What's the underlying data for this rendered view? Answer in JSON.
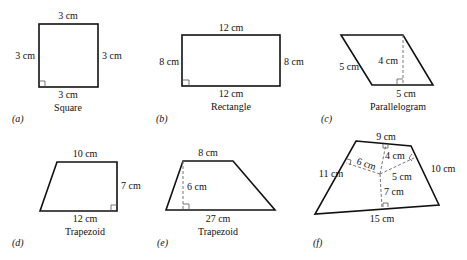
{
  "figures": [
    {
      "id": "a",
      "caption": "(a)",
      "name": "Square",
      "labels": {
        "top": "3 cm",
        "left": "3 cm",
        "right": "3 cm",
        "bottom": "3 cm"
      }
    },
    {
      "id": "b",
      "caption": "(b)",
      "name": "Rectangle",
      "labels": {
        "top": "12 cm",
        "left": "8 cm",
        "right": "8 cm",
        "bottom": "12 cm"
      }
    },
    {
      "id": "c",
      "caption": "(c)",
      "name": "Parallelogram",
      "labels": {
        "side": "5 cm",
        "height": "4 cm",
        "base": "5 cm"
      }
    },
    {
      "id": "d",
      "caption": "(d)",
      "name": "Trapezoid",
      "labels": {
        "top": "10 cm",
        "right": "7 cm",
        "bottom": "12 cm"
      }
    },
    {
      "id": "e",
      "caption": "(e)",
      "name": "Trapezoid",
      "labels": {
        "top": "8 cm",
        "height": "6 cm",
        "bottom": "27 cm"
      }
    },
    {
      "id": "f",
      "caption": "(f)",
      "name": "",
      "labels": {
        "top": "9 cm",
        "left": "11 cm",
        "right": "10 cm",
        "bottom": "15 cm",
        "to_top": "4 cm",
        "to_left": "6 cm",
        "to_right": "5 cm",
        "to_bottom": "7 cm"
      }
    }
  ]
}
